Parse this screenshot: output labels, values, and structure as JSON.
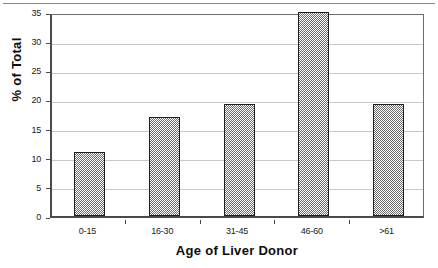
{
  "chart_data": {
    "type": "bar",
    "title": "",
    "xlabel": "Age of Liver Donor",
    "ylabel": "% of Total",
    "categories": [
      "0-15",
      "16-30",
      "31-45",
      "46-60",
      ">61"
    ],
    "values": [
      11,
      17,
      19.2,
      35,
      19.2
    ],
    "ylim": [
      0,
      35
    ],
    "yticks": [
      0,
      5,
      10,
      15,
      20,
      25,
      30,
      35
    ],
    "ytick_labels": [
      "0",
      "5",
      "10",
      "15",
      "20",
      "25",
      "30",
      "35"
    ],
    "grid": true,
    "grid_axis": "y",
    "legend": false,
    "legend_position": "none",
    "series": [
      {
        "name": "% of Total",
        "values": [
          11,
          17,
          19.2,
          35,
          19.2
        ]
      }
    ],
    "colors": {
      "bar_fill": "#6e6e6e",
      "bar_edge": "#1e1e1e",
      "gridline": "#c9c9c9",
      "axis": "#4a4a4a",
      "text": "#1a1a1a",
      "background": "#ffffff"
    }
  }
}
